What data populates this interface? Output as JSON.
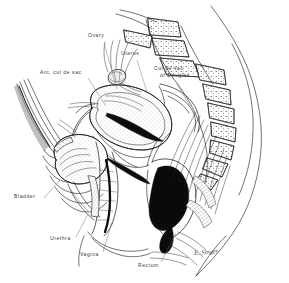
{
  "figure": {
    "background_color": "#ffffff",
    "ink_color": "#1a1a1a",
    "label_color": "#3a3a3a",
    "width": 289,
    "height": 283
  },
  "labels": [
    {
      "id": "ovary",
      "text": "Ovary",
      "x": 88,
      "y": 35,
      "leader_from": [
        104,
        43
      ],
      "leader_to": [
        117,
        89
      ]
    },
    {
      "id": "uterus",
      "text": "Uterus",
      "x": 121,
      "y": 53,
      "leader_from": [
        137,
        60
      ],
      "leader_to": [
        146,
        92
      ]
    },
    {
      "id": "ant-cul-de-sac",
      "text": "Ant. cul de sac",
      "x": 40,
      "y": 72,
      "leader_from": [
        88,
        78
      ],
      "leader_to": [
        106,
        106
      ]
    },
    {
      "id": "cul-de-sac-of-douglas",
      "text_line1": "Cul de sac",
      "text_line2": "of Douglas",
      "x": 154,
      "y": 68,
      "leader_from": [
        176,
        83
      ],
      "leader_to": [
        190,
        106
      ]
    },
    {
      "id": "bladder",
      "text": "Bladder",
      "x": 16,
      "y": 196,
      "leader_from": [
        44,
        198
      ],
      "leader_to": [
        58,
        180
      ]
    },
    {
      "id": "urethra",
      "text": "Urethra",
      "x": 52,
      "y": 238,
      "leader_from": [
        76,
        237
      ],
      "leader_to": [
        87,
        215
      ]
    },
    {
      "id": "vagina",
      "text": "Vagina",
      "x": 82,
      "y": 254,
      "leader_from": [
        103,
        252
      ],
      "leader_to": [
        112,
        222
      ]
    },
    {
      "id": "rectum",
      "text": "Rectum",
      "x": 140,
      "y": 265,
      "leader_from": [
        161,
        262
      ],
      "leader_to": [
        175,
        233
      ]
    }
  ],
  "signature": {
    "text": "E. Singer",
    "x": 194,
    "y": 250
  },
  "structures": [
    {
      "id": "abdominal-wall",
      "name": "anterior abdominal wall"
    },
    {
      "id": "sacrum",
      "name": "sacrum and sacral vertebrae"
    },
    {
      "id": "uterus-body",
      "name": "uterine body (anteverted)"
    },
    {
      "id": "endometrial-cavity",
      "name": "endometrial cavity"
    },
    {
      "id": "cervix",
      "name": "cervix"
    },
    {
      "id": "bladder-lumen",
      "name": "urinary bladder"
    },
    {
      "id": "urethra-canal",
      "name": "urethra"
    },
    {
      "id": "vaginal-canal",
      "name": "vaginal canal"
    },
    {
      "id": "rectum-lumen",
      "name": "rectum and anal canal"
    },
    {
      "id": "ovary-body",
      "name": "ovary"
    },
    {
      "id": "fallopian-tube",
      "name": "fallopian tube"
    },
    {
      "id": "pubic-symphysis",
      "name": "pubic symphysis"
    },
    {
      "id": "levator-muscle",
      "name": "levator ani / pelvic floor musculature"
    }
  ]
}
